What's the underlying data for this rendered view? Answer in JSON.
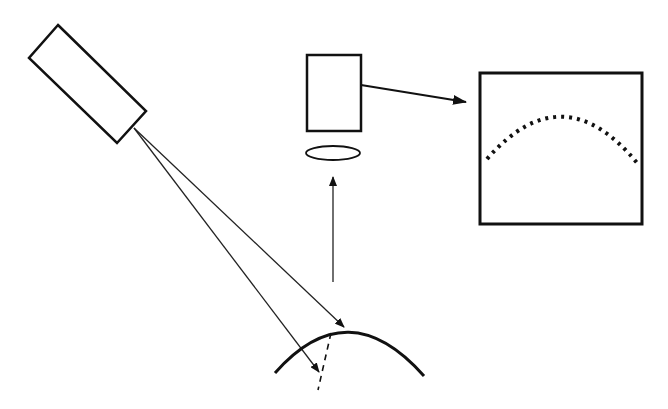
{
  "diagram": {
    "colors": {
      "stroke": "#111111",
      "background": "#ffffff"
    },
    "components": [
      {
        "id": "light-source",
        "type": "rotated-rectangle"
      },
      {
        "id": "incident-ray-1",
        "type": "arrow"
      },
      {
        "id": "incident-ray-2",
        "type": "arrow"
      },
      {
        "id": "curved-surface",
        "type": "arc"
      },
      {
        "id": "subsurface-dashed-line",
        "type": "dashed-line"
      },
      {
        "id": "reflected-ray",
        "type": "arrow"
      },
      {
        "id": "lens",
        "type": "ellipse"
      },
      {
        "id": "camera",
        "type": "rectangle"
      },
      {
        "id": "camera-to-screen-arrow",
        "type": "arrow"
      },
      {
        "id": "display-screen",
        "type": "rectangle"
      },
      {
        "id": "detected-profile",
        "type": "dotted-arc"
      }
    ]
  }
}
